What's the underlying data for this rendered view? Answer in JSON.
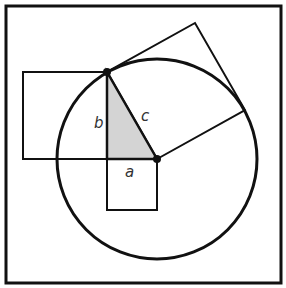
{
  "diagram": {
    "labels": {
      "a": "a",
      "b": "b",
      "c": "c"
    },
    "colors": {
      "stroke": "#111111",
      "triangle_fill": "#d4d4d4",
      "background": "#ffffff"
    },
    "geometry": {
      "frame": [
        5,
        5,
        276,
        278
      ],
      "center": [
        157,
        159
      ],
      "top_point": [
        107,
        72
      ],
      "radius": 100,
      "square_b": [
        23,
        72,
        84,
        87
      ],
      "square_a": [
        107,
        159,
        50,
        51
      ],
      "square_c": [
        [
          107,
          72
        ],
        [
          157,
          159
        ],
        [
          245,
          110
        ],
        [
          195,
          23
        ]
      ]
    }
  }
}
